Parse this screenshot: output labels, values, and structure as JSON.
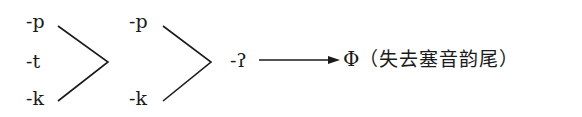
{
  "column1": {
    "items": [
      "-p",
      "-t",
      "-k"
    ]
  },
  "column2": {
    "items": [
      "-p",
      "-k"
    ]
  },
  "intermediate": "-ʔ",
  "result": {
    "symbol": "Φ",
    "note": "（失去塞音韵尾）"
  }
}
